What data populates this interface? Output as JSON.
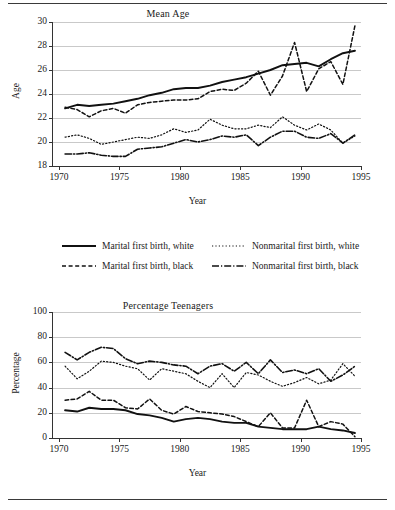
{
  "figure": {
    "x_axis_label": "Year",
    "border_color": "#3a3a3a"
  },
  "legend": {
    "items": [
      {
        "label": "Marital first birth, white",
        "style": "solid",
        "name": "legend-marital-white"
      },
      {
        "label": "Nonmarital first birth, white",
        "style": "dotted",
        "name": "legend-nonmarital-white"
      },
      {
        "label": "Marital first birth, black",
        "style": "dashed",
        "name": "legend-marital-black"
      },
      {
        "label": "Nonmarital first birth, black",
        "style": "dashdot",
        "name": "legend-nonmarital-black"
      }
    ]
  },
  "chart_data": [
    {
      "type": "line",
      "id": "mean-age",
      "title": "Mean Age",
      "xlabel": "Year",
      "ylabel": "Age",
      "xlim": [
        1969.5,
        1995.0
      ],
      "ylim": [
        18,
        30
      ],
      "xticks": [
        1970,
        1975,
        1980,
        1985,
        1990,
        1995
      ],
      "yticks": [
        18,
        20,
        22,
        24,
        26,
        28,
        30
      ],
      "grid": "horizontal",
      "legend_position": "below-plot",
      "x": [
        1970.5,
        1971.5,
        1972.5,
        1973.5,
        1974.5,
        1975.5,
        1976.5,
        1977.5,
        1978.5,
        1979.5,
        1980.5,
        1981.5,
        1982.5,
        1983.5,
        1984.5,
        1985.5,
        1986.5,
        1987.5,
        1988.5,
        1989.5,
        1990.5,
        1991.5,
        1992.5,
        1993.5,
        1994.5
      ],
      "series": [
        {
          "name": "Marital first birth, white",
          "style": "solid",
          "values": [
            22.8,
            23.1,
            23.0,
            23.1,
            23.2,
            23.4,
            23.6,
            23.9,
            24.1,
            24.4,
            24.5,
            24.5,
            24.7,
            25.0,
            25.2,
            25.4,
            25.7,
            26.0,
            26.4,
            26.5,
            26.6,
            26.3,
            26.9,
            27.4,
            27.6
          ]
        },
        {
          "name": "Marital first birth, black",
          "style": "dashed",
          "values": [
            22.9,
            22.7,
            22.1,
            22.6,
            22.8,
            22.4,
            23.1,
            23.3,
            23.4,
            23.5,
            23.5,
            23.6,
            24.2,
            24.4,
            24.3,
            24.9,
            25.9,
            23.9,
            25.5,
            28.3,
            24.2,
            26.1,
            26.7,
            24.8,
            29.7
          ]
        },
        {
          "name": "Nonmarital first birth, white",
          "style": "dotted",
          "values": [
            20.4,
            20.6,
            20.3,
            19.8,
            20.0,
            20.2,
            20.4,
            20.3,
            20.6,
            21.1,
            20.8,
            21.0,
            21.9,
            21.4,
            21.1,
            21.1,
            21.4,
            21.2,
            22.1,
            21.4,
            21.0,
            21.5,
            21.0,
            19.9,
            20.5
          ]
        },
        {
          "name": "Nonmarital first birth, black",
          "style": "dashdot",
          "values": [
            19.0,
            19.0,
            19.1,
            18.9,
            18.8,
            18.8,
            19.4,
            19.5,
            19.6,
            19.9,
            20.2,
            20.0,
            20.2,
            20.5,
            20.4,
            20.6,
            19.7,
            20.4,
            20.9,
            20.9,
            20.4,
            20.3,
            20.7,
            19.9,
            20.6
          ]
        }
      ]
    },
    {
      "type": "line",
      "id": "percentage-teenagers",
      "title": "Percentage Teenagers",
      "xlabel": "Year",
      "ylabel": "Percentage",
      "xlim": [
        1969.5,
        1995.0
      ],
      "ylim": [
        0,
        100
      ],
      "xticks": [
        1970,
        1975,
        1980,
        1985,
        1990,
        1995
      ],
      "yticks": [
        0,
        20,
        40,
        60,
        80,
        100
      ],
      "grid": "horizontal",
      "legend_position": "above-plot",
      "x": [
        1970.5,
        1971.5,
        1972.5,
        1973.5,
        1974.5,
        1975.5,
        1976.5,
        1977.5,
        1978.5,
        1979.5,
        1980.5,
        1981.5,
        1982.5,
        1983.5,
        1984.5,
        1985.5,
        1986.5,
        1987.5,
        1988.5,
        1989.5,
        1990.5,
        1991.5,
        1992.5,
        1993.5,
        1994.5
      ],
      "series": [
        {
          "name": "Nonmarital first birth, black",
          "style": "dashdot",
          "values": [
            68,
            62,
            68,
            72,
            71,
            63,
            59,
            61,
            60,
            58,
            57,
            51,
            57,
            59,
            53,
            60,
            51,
            62,
            52,
            54,
            51,
            55,
            45,
            50,
            57
          ]
        },
        {
          "name": "Nonmarital first birth, white",
          "style": "dotted",
          "values": [
            57,
            47,
            53,
            61,
            60,
            57,
            55,
            46,
            55,
            53,
            51,
            45,
            40,
            51,
            40,
            52,
            50,
            45,
            41,
            44,
            48,
            43,
            46,
            59,
            49
          ]
        },
        {
          "name": "Marital first birth, black",
          "style": "dashed",
          "values": [
            30,
            31,
            37,
            30,
            30,
            24,
            23,
            31,
            22,
            19,
            25,
            21,
            20,
            19,
            17,
            13,
            9,
            20,
            8,
            8,
            30,
            9,
            13,
            11,
            1
          ]
        },
        {
          "name": "Marital first birth, white",
          "style": "solid",
          "values": [
            22,
            21,
            24,
            23,
            23,
            22,
            19,
            18,
            16,
            13,
            15,
            16,
            15,
            13,
            12,
            12,
            9,
            8,
            7,
            7,
            7,
            9,
            7,
            6,
            4
          ]
        }
      ]
    }
  ]
}
